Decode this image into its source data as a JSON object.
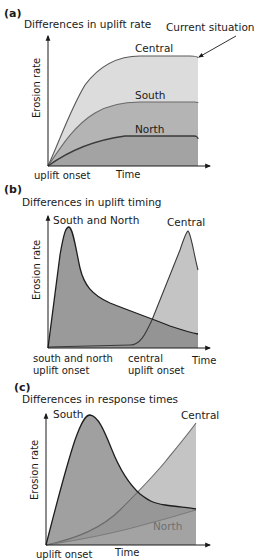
{
  "panels": [
    {
      "letter": "(a)",
      "title": "Differences in uplift rate",
      "annotation": "Current situation",
      "y_axis_label": "Erosion rate",
      "x_axis_label": "Time",
      "x_start_label": "uplift onset",
      "curves": [
        {
          "name": "Central",
          "color": "#dcdcdc"
        },
        {
          "name": "South",
          "color": "#b4b4b4"
        },
        {
          "name": "North",
          "color": "#9a9a9a"
        }
      ]
    },
    {
      "letter": "(b)",
      "title": "Differences in uplift timing",
      "y_axis_label": "Erosion rate",
      "x_axis_label": "Time",
      "x_start_label_line1": "south and north",
      "x_start_label_line2": "uplift onset",
      "x_mid_label_line1": "central",
      "x_mid_label_line2": "uplift onset",
      "curves": [
        {
          "name": "South and North",
          "color": "#8f8f8f"
        },
        {
          "name": "Central",
          "color": "#c4c4c4"
        }
      ]
    },
    {
      "letter": "(c)",
      "title": "Differences in response times",
      "y_axis_label": "Erosion rate",
      "x_axis_label": "Time",
      "x_start_label": "uplift onset",
      "curves": [
        {
          "name": "South",
          "color": "#8f8f8f"
        },
        {
          "name": "Central",
          "color": "#c4c4c4"
        },
        {
          "name": "North",
          "color": "#a8a8a8"
        }
      ]
    }
  ]
}
